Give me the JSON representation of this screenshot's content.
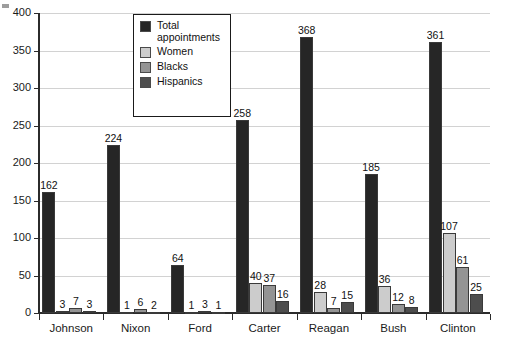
{
  "chart_data": {
    "type": "bar",
    "title": "",
    "xlabel": "",
    "ylabel": "",
    "ylim": [
      0,
      400
    ],
    "yticks": [
      0,
      50,
      100,
      150,
      200,
      250,
      300,
      350,
      400
    ],
    "grid": true,
    "legend_position": "top-center-inside",
    "categories": [
      "Johnson",
      "Nixon",
      "Ford",
      "Carter",
      "Reagan",
      "Bush",
      "Clinton"
    ],
    "series": [
      {
        "name": "Total appointments",
        "color": "#262626",
        "values": [
          162,
          224,
          64,
          258,
          368,
          185,
          361
        ]
      },
      {
        "name": "Women",
        "color": "#cccccc",
        "values": [
          3,
          1,
          1,
          40,
          28,
          36,
          107
        ]
      },
      {
        "name": "Blacks",
        "color": "#949494",
        "values": [
          7,
          6,
          3,
          37,
          7,
          12,
          61
        ]
      },
      {
        "name": "Hispanics",
        "color": "#4d4d4d",
        "values": [
          3,
          2,
          1,
          16,
          15,
          8,
          25
        ]
      }
    ]
  },
  "legend": {
    "entries": [
      {
        "label": "Total appointments",
        "color": "#262626"
      },
      {
        "label": "Women",
        "color": "#cccccc"
      },
      {
        "label": "Blacks",
        "color": "#949494"
      },
      {
        "label": "Hispanics",
        "color": "#4d4d4d"
      }
    ]
  },
  "axes": {
    "y_tick_labels": [
      "400",
      "350",
      "300",
      "250",
      "200",
      "150",
      "100",
      "50",
      "0"
    ],
    "x_tick_labels": [
      "Johnson",
      "Nixon",
      "Ford",
      "Carter",
      "Reagan",
      "Bush",
      "Clinton"
    ]
  },
  "bar_value_labels": {
    "Johnson": [
      "162",
      "3",
      "7",
      "3"
    ],
    "Nixon": [
      "224",
      "1",
      "6",
      "2"
    ],
    "Ford": [
      "64",
      "1",
      "3",
      "1"
    ],
    "Carter": [
      "258",
      "40",
      "37",
      "16"
    ],
    "Reagan": [
      "368",
      "28",
      "7",
      "15"
    ],
    "Bush": [
      "185",
      "36",
      "12",
      "8"
    ],
    "Clinton": [
      "361",
      "107",
      "61",
      "25"
    ]
  },
  "colors": {
    "axis": "#2b2b2b",
    "gridline": "#d2d2d2",
    "background": "#ffffff",
    "text": "#1a1a1a"
  }
}
